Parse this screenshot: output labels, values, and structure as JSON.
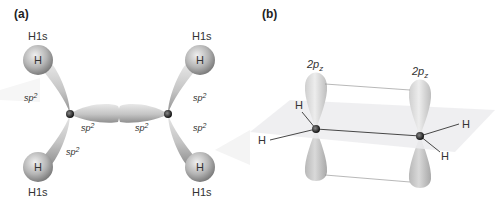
{
  "panel_a": {
    "label": "(a)",
    "h_orbital": "H1s",
    "h_atom": "H",
    "sp2_base": "sp",
    "sp2_sup": "2"
  },
  "panel_b": {
    "label": "(b)",
    "p_base": "2p",
    "p_sub": "z",
    "h_atom": "H"
  },
  "colors": {
    "lobe_light": "#e6e6e6",
    "lobe_dark": "#9a9a9a",
    "plane": "#ececee",
    "atom": "#222222"
  }
}
